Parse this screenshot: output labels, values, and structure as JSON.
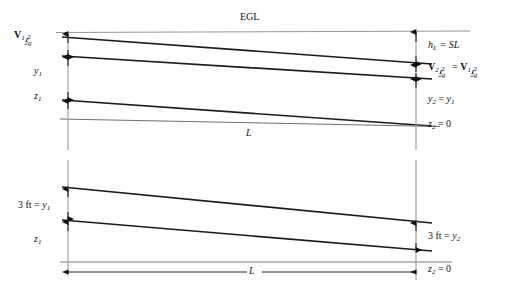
{
  "diagram": {
    "background_color": "#ffffff",
    "line_color": "#1a1a1a",
    "thin_line_color": "#808080",
    "labels": {
      "egl": "EGL",
      "velocity_head_1": "V₁²/2g",
      "depth_1": "y₁",
      "elevation_1": "z₁",
      "length_upper": "L",
      "head_loss": "hₖ = SL",
      "velocity_head_equality": "V₂²/2g = V₁²/2g",
      "depth_equality": "y₂ = y₁",
      "datum_2_upper": "z₂ = 0",
      "depth_1_lower": "3 ft = y₁",
      "elevation_1_lower": "z₁",
      "depth_2_lower": "3 ft = y₂",
      "datum_2_lower": "z₂ = 0",
      "length_lower": "L"
    },
    "label_parts": {
      "egl": "EGL",
      "hl_symbol": "h",
      "hl_sub": "L",
      "hl_rest": " = SL",
      "V": "V",
      "sub_1": "1",
      "sub_2": "2",
      "num_2": "2",
      "den_2g": "2g",
      "equals": " = ",
      "y": "y",
      "z": "z",
      "zero": " = 0",
      "y2_eq_y1_left": "y",
      "three_ft": "3 ft = ",
      "L": "L"
    },
    "geometry": {
      "upper_section": {
        "left_x": 68,
        "right_x": 416,
        "egl_y": 31,
        "egl_line_left_y": 33,
        "egl_line_right_y": 31,
        "energy_line": {
          "x1": 68,
          "y1": 38,
          "x2": 416,
          "y2": 64
        },
        "water_surface": {
          "x1": 68,
          "y1": 56,
          "x2": 416,
          "y2": 78
        },
        "channel_bed": {
          "x1": 68,
          "y1": 100,
          "x2": 416,
          "y2": 125
        },
        "datum": {
          "x1": 68,
          "y1": 118,
          "x2": 416,
          "y2": 126
        }
      },
      "lower_section": {
        "left_x": 68,
        "right_x": 416,
        "water_surface": {
          "x1": 68,
          "y1": 188,
          "x2": 416,
          "y2": 222
        },
        "channel_bed": {
          "x1": 68,
          "y1": 220,
          "x2": 416,
          "y2": 250
        },
        "datum": {
          "x1": 68,
          "y1": 262,
          "x2": 416,
          "y2": 262
        },
        "dimension_line_y": 272
      }
    }
  }
}
